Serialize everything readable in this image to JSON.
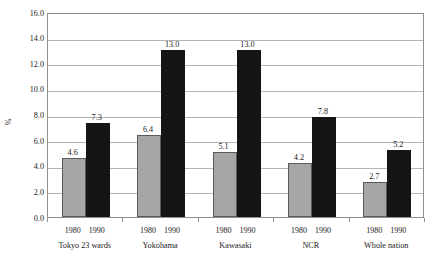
{
  "chart_data": {
    "type": "bar",
    "title": "",
    "subtitle": "",
    "xlabel": "",
    "ylabel": "%",
    "ylim": [
      0.0,
      16.0
    ],
    "ytick_step": 2.0,
    "ytick_labels": [
      "16.0",
      "14.0",
      "12.0",
      "10.0",
      "8.0",
      "6.0",
      "4.0",
      "2.0",
      "0.0"
    ],
    "ytick_values": [
      16.0,
      14.0,
      12.0,
      10.0,
      8.0,
      6.0,
      4.0,
      2.0,
      0.0
    ],
    "grid": true,
    "grid_axis": "y",
    "legend": "none",
    "categories": [
      "Tokyo 23 wards",
      "Yokohama",
      "Kawasaki",
      "NCR",
      "Whole nation"
    ],
    "series": [
      {
        "name": "1980",
        "color": "#a6a6a6",
        "values": [
          4.6,
          6.4,
          5.1,
          4.2,
          2.7
        ],
        "labels": [
          "4.6",
          "6.4",
          "5.1",
          "4.2",
          "2.7"
        ]
      },
      {
        "name": "1990",
        "color": "#151515",
        "values": [
          7.3,
          13.0,
          13.0,
          7.8,
          5.2
        ],
        "labels": [
          "7.3",
          "13.0",
          "13.0",
          "7.8",
          "5.2"
        ]
      }
    ]
  },
  "colors": {
    "background": "#ffffff",
    "plot_background": "#ffffff",
    "axis_line": "#8f8f8f",
    "gridline": "#b4b4b4",
    "text": "#1a1a1a",
    "series_1980": "#a6a6a6",
    "series_1990": "#151515"
  }
}
